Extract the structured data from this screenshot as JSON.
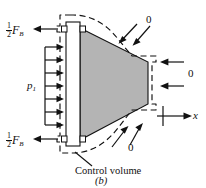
{
  "figure": {
    "caption": "(b)",
    "domain_note": "control volume free-body diagram of a nozzle",
    "colors": {
      "line": "#111111",
      "nozzle_fill": "#b4b4b4",
      "background": "#ffffff"
    }
  },
  "labels": {
    "bolt_force_top": {
      "fraction_numerator": "1",
      "fraction_denominator": "2",
      "symbol": "F",
      "subscript": "B"
    },
    "bolt_force_bottom": {
      "fraction_numerator": "1",
      "fraction_denominator": "2",
      "symbol": "F",
      "subscript": "B"
    },
    "pressure": {
      "symbol": "p",
      "subscript": "1"
    },
    "zero_top": "0",
    "zero_right": "0",
    "zero_bottom": "0",
    "axis_x": "x",
    "control_volume": "Control volume",
    "caption": "(b)"
  },
  "arrows": {
    "pressure_arrow_count": 7,
    "pressure_direction": "right",
    "bolt_force_direction": "left",
    "zero_top_direction": "down-left",
    "zero_right_direction": "left",
    "zero_bottom_direction": "up-left",
    "axis_direction": "right"
  }
}
